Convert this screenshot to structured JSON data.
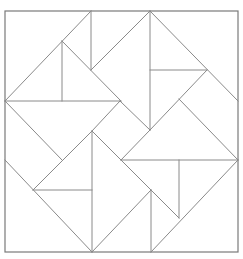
{
  "diagram": {
    "title": "",
    "colors": {
      "background": "#ffffff",
      "line": "#8a8a8a",
      "frame": "#7a7a7a"
    },
    "grid_units": 8,
    "pieces": [
      {
        "id": "center-diamond",
        "shape": "square",
        "rotated": true
      },
      {
        "id": "tl-large-triangle",
        "shape": "triangle"
      },
      {
        "id": "tr-large-triangle",
        "shape": "triangle"
      },
      {
        "id": "bl-large-triangle",
        "shape": "triangle"
      },
      {
        "id": "br-large-triangle",
        "shape": "triangle"
      }
    ]
  }
}
